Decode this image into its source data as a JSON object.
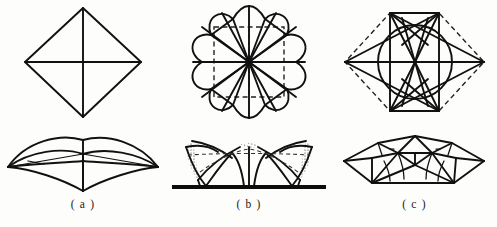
{
  "sheet": {
    "title": "Tensile membrane structure plans and elevations",
    "background_color": "#fdfdfb",
    "ink_color": "#111111",
    "width": 497,
    "height": 227
  },
  "columns": [
    {
      "key": "a",
      "caption": "( a )",
      "plan_name": "square-plan-diagram",
      "plan_description": "Square rotated 45 degrees (diamond) with horizontal and vertical diagonals crossing at centre",
      "elevation_name": "saddle-elevation-diagram",
      "elevation_description": "Perspective of four-point hypar tent with low centre mast and curved edge cables"
    },
    {
      "key": "b",
      "caption": "( b )",
      "plan_name": "rosette-plan-diagram",
      "plan_description": "Eight-lobed scalloped rosette with radial cables from centre, dashed square and dashed orthogonal axes",
      "elevation_name": "membrane-elevation-diagram",
      "elevation_description": "Elevation of multi-cone membrane canopy with stippled fabric panels, dashed guide lines and ground line"
    },
    {
      "key": "c",
      "caption": "( c )",
      "plan_name": "hexagon-star-plan-diagram",
      "plan_description": "Hexagon with dashed perimeter containing inscribed circle and eight-point star of radial cables",
      "elevation_name": "faceted-tent-elevation-diagram",
      "elevation_description": "Perspective of faceted polyhedral tent with multiple ridge folds"
    }
  ],
  "styles": {
    "solid_stroke": "#111111",
    "dashed_stroke": "#222222",
    "ground_stroke": "#0d0d0d",
    "stipple_fill": "#2b2b2b"
  }
}
